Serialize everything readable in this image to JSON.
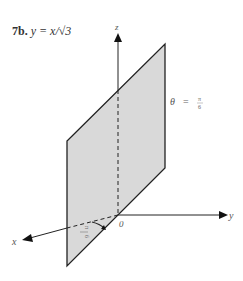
{
  "title": {
    "number": "7b.",
    "equation": "y = x/√3"
  },
  "diagram": {
    "axes": {
      "x_label": "x",
      "y_label": "y",
      "z_label": "z",
      "origin_label": "0"
    },
    "plane_label": {
      "theta": "θ",
      "equals": "=",
      "numerator": "π",
      "denominator": "6"
    },
    "angle_label": {
      "numerator": "π",
      "denominator": "6"
    },
    "colors": {
      "plane_fill": "#d9d9d9",
      "stroke": "#222222",
      "background": "#ffffff"
    }
  }
}
